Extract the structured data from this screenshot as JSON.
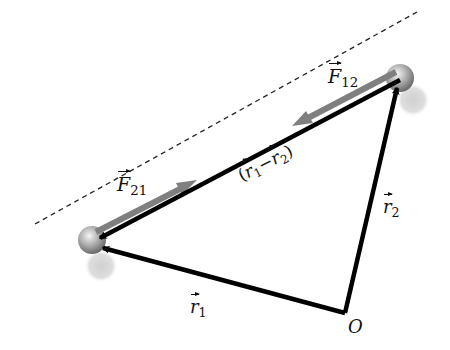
{
  "diagram": {
    "colors": {
      "vector": "#000000",
      "force": "#808080",
      "line": "#333333",
      "particle": "#a8a8a8",
      "shadow": "#d6d6d6"
    },
    "labels": {
      "F12": {
        "symbol": "F",
        "subscript": "12"
      },
      "F21": {
        "symbol": "F",
        "subscript": "21"
      },
      "r1": {
        "symbol": "r",
        "subscript": "1"
      },
      "r2": {
        "symbol": "r",
        "subscript": "2"
      },
      "relative": {
        "open": "(",
        "a": "r",
        "a_sub": "1",
        "minus": "−",
        "b": "r",
        "b_sub": "2",
        "close": ")"
      },
      "origin": "O"
    },
    "points": {
      "particle_1": [
        92,
        240
      ],
      "particle_2": [
        400,
        78
      ],
      "origin": [
        345,
        313
      ]
    }
  }
}
